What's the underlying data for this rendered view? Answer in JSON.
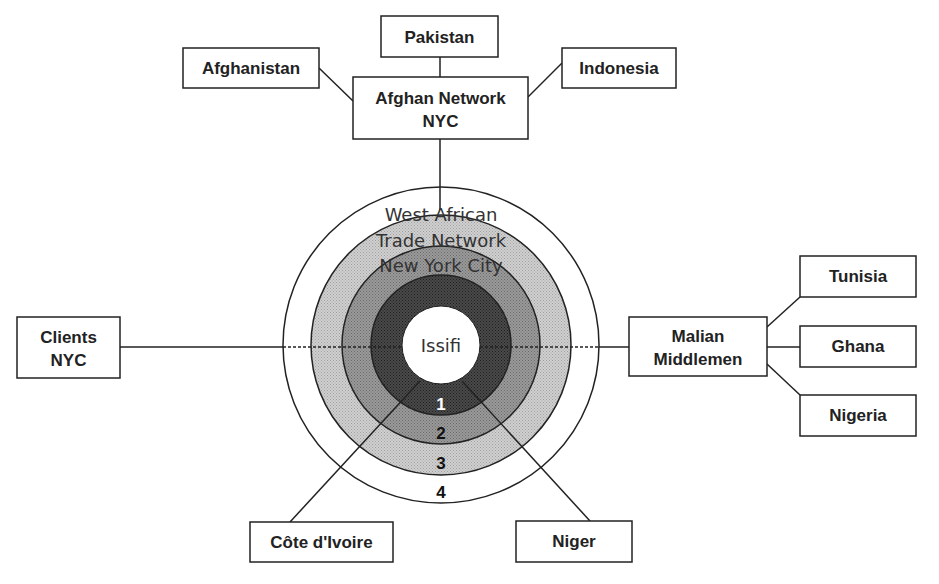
{
  "diagram": {
    "center": {
      "label": "Issifi"
    },
    "rings_label": [
      "West African",
      "Trade Network",
      "New York City"
    ],
    "ring_numbers": [
      "1",
      "2",
      "3",
      "4"
    ],
    "colors": {
      "line": "#222222",
      "ring1": "#3a3a3a",
      "ring2": "#8e8e8e",
      "ring3": "#c4c4c4",
      "ring4": "#ffffff",
      "center": "#ffffff"
    },
    "nodes": {
      "afghan_network": {
        "line1": "Afghan Network",
        "line2": "NYC"
      },
      "pakistan": {
        "label": "Pakistan"
      },
      "afghanistan": {
        "label": "Afghanistan"
      },
      "indonesia": {
        "label": "Indonesia"
      },
      "clients": {
        "line1": "Clients",
        "line2": "NYC"
      },
      "malian": {
        "line1": "Malian",
        "line2": "Middlemen"
      },
      "tunisia": {
        "label": "Tunisia"
      },
      "ghana": {
        "label": "Ghana"
      },
      "nigeria": {
        "label": "Nigeria"
      },
      "cote_divoire": {
        "label": "Côte d'Ivoire"
      },
      "niger": {
        "label": "Niger"
      }
    }
  }
}
